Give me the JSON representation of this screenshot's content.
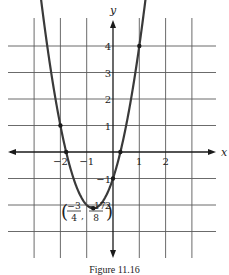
{
  "chart_data": {
    "type": "line",
    "title": "",
    "caption": "Figure 11.16",
    "function": "y = 2x^2 + 3x - 1",
    "xlabel": "x",
    "ylabel": "y",
    "xlim": [
      -4,
      4
    ],
    "ylim": [
      -4,
      5
    ],
    "grid": true,
    "x_ticks": [
      {
        "value": -2,
        "label": "−2"
      },
      {
        "value": -1,
        "label": "−1"
      },
      {
        "value": 1,
        "label": "1"
      },
      {
        "value": 2,
        "label": "2"
      }
    ],
    "y_ticks": [
      {
        "value": 4,
        "label": "4"
      },
      {
        "value": 3,
        "label": "3"
      },
      {
        "value": 2,
        "label": "2"
      },
      {
        "value": 1,
        "label": "1"
      },
      {
        "value": -1,
        "label": "−1"
      },
      {
        "value": -2,
        "label": "2"
      }
    ],
    "series": [
      {
        "name": "parabola",
        "x": [
          -2.75,
          -2.5,
          -2,
          -1.5,
          -1,
          -0.75,
          -0.5,
          0,
          0.5,
          1,
          1.3
        ],
        "y": [
          6.875,
          4.0,
          1,
          -1,
          -2,
          -2.125,
          -2,
          -1,
          1,
          4,
          6.28
        ]
      }
    ],
    "marked_points": [
      {
        "x": -2,
        "y": 1
      },
      {
        "x": -0.75,
        "y": -2.125
      },
      {
        "x": 0,
        "y": -1
      },
      {
        "x": 1,
        "y": 4
      },
      {
        "x": -1.78,
        "y": 0
      },
      {
        "x": 0.28,
        "y": 0
      }
    ],
    "annotations": [
      {
        "text": "(−3/4, −17/8)",
        "x": -0.75,
        "y": -2.125,
        "num1": "−3",
        "den1": "4",
        "num2": "−17",
        "den2": "8"
      }
    ]
  },
  "colors": {
    "grid": "#5a5a5a",
    "axis": "#1a1a1a",
    "curve": "#3a3a3a",
    "text": "#222222",
    "background": "#ffffff"
  }
}
